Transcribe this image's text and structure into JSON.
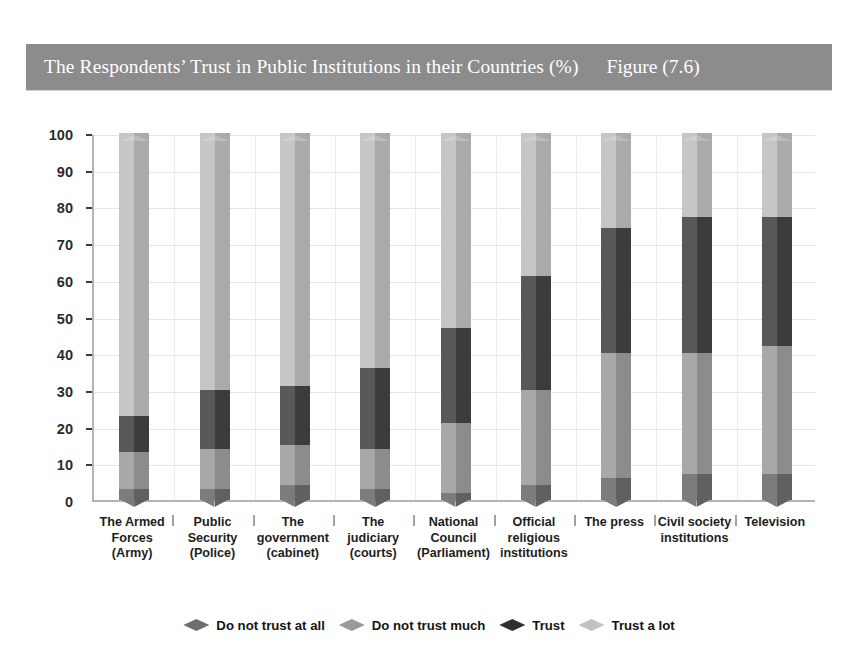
{
  "title": {
    "text": "The Respondents’ Trust in Public Institutions in their Countries (%)",
    "figure": "Figure (7.6)",
    "bar_color": "#8c8c8c"
  },
  "chart_data": {
    "type": "bar",
    "stacked": true,
    "title": "The Respondents’ Trust in Public Institutions in their Countries (%)",
    "subtitle": "Figure (7.6)",
    "xlabel": "",
    "ylabel": "",
    "ylim": [
      0,
      100
    ],
    "yticks": [
      0,
      10,
      20,
      30,
      40,
      50,
      60,
      70,
      80,
      90,
      100
    ],
    "grid": true,
    "legend_position": "bottom",
    "categories": [
      "The Armed Forces (Army)",
      "Public Security (Police)",
      "The government (cabinet)",
      "The judiciary (courts)",
      "National Council (Parliament)",
      "Official religious institutions",
      "The press",
      "Civil society institutions",
      "Television"
    ],
    "category_lines": [
      [
        "The Armed",
        "Forces",
        "(Army)"
      ],
      [
        "Public",
        "Security",
        "(Police)"
      ],
      [
        "The",
        "government",
        "(cabinet)"
      ],
      [
        "The",
        "judiciary",
        "(courts)"
      ],
      [
        "National",
        "Council",
        "(Parliament)"
      ],
      [
        "Official",
        "religious",
        "institutions"
      ],
      [
        "The press"
      ],
      [
        "Civil society",
        "institutions"
      ],
      [
        "Television"
      ]
    ],
    "series": [
      {
        "name": "Do not trust at all",
        "color": "#6e6e6e",
        "values": [
          3,
          3,
          4,
          3,
          2,
          4,
          6,
          7,
          7
        ]
      },
      {
        "name": "Do not trust much",
        "color": "#9a9a9a",
        "values": [
          10,
          11,
          11,
          11,
          19,
          26,
          34,
          33,
          35
        ]
      },
      {
        "name": "Trust",
        "color": "#4a4a4a",
        "values": [
          10,
          16,
          16,
          22,
          26,
          31,
          34,
          37,
          35
        ]
      },
      {
        "name": "Trust a lot",
        "color": "#b8b8b8",
        "values": [
          77,
          70,
          69,
          64,
          53,
          39,
          26,
          23,
          23
        ]
      }
    ]
  },
  "legend": {
    "items": [
      {
        "label": "Do not trust at all",
        "color": "#6e6e6e"
      },
      {
        "label": "Do not trust much",
        "color": "#9a9a9a"
      },
      {
        "label": "Trust",
        "color": "#2f2f2f"
      },
      {
        "label": "Trust a lot",
        "color": "#c2c2c2"
      }
    ]
  }
}
